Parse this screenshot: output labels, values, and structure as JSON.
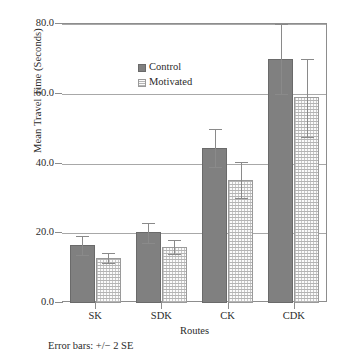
{
  "footnote": "Error bars: +/− 2 SE",
  "legend": {
    "items": [
      {
        "label": "Control",
        "swatch": "dark-gray-solid"
      },
      {
        "label": "Motivated",
        "swatch": "light-gray-stippled"
      }
    ]
  },
  "colors": {
    "control": "#808080",
    "motivated": "#fbfbfb",
    "axis": "#8d8d8d",
    "grid": "#a8a8a8"
  },
  "chart_data": {
    "type": "bar",
    "title": "",
    "xlabel": "Routes",
    "ylabel": "Mean Travel Time (Seconds)",
    "categories": [
      "SK",
      "SDK",
      "CK",
      "CDK"
    ],
    "ylim": [
      0.0,
      80.0
    ],
    "yticks": [
      "0.0",
      "20.0",
      "40.0",
      "60.0",
      "80.0"
    ],
    "ytick_values": [
      0.0,
      20.0,
      40.0,
      60.0,
      80.0
    ],
    "grid": "horizontal",
    "legend_position": "inside-top-left",
    "error_bars": "+/- 2 SE",
    "series": [
      {
        "name": "Control",
        "values": [
          16.5,
          20.3,
          44.5,
          70.0
        ],
        "err_low": [
          13.8,
          17.3,
          39.0,
          60.0
        ],
        "err_high": [
          19.3,
          23.0,
          50.0,
          80.0
        ]
      },
      {
        "name": "Motivated",
        "values": [
          12.9,
          16.1,
          35.3,
          59.0
        ],
        "err_low": [
          11.5,
          14.0,
          30.0,
          47.5
        ],
        "err_high": [
          14.3,
          18.2,
          40.4,
          70.0
        ]
      }
    ]
  }
}
